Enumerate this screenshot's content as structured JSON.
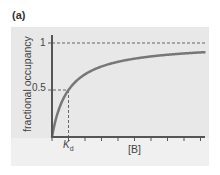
{
  "panel_label": "(a)",
  "chart_data": {
    "type": "line",
    "title": "",
    "xlabel": "[B]",
    "ylabel": "fractional occupancy",
    "ytick_labels": [
      "0.5",
      "1"
    ],
    "xtick_labels": [
      "K_d"
    ],
    "x_annotation": {
      "label": "K",
      "subscript": "d",
      "value": 1
    },
    "asymptote": {
      "y": 1,
      "style": "dashed"
    },
    "reference_line": {
      "x": 1,
      "y": 0.5,
      "style": "dashed"
    },
    "grid": false,
    "ylim": [
      0,
      1
    ],
    "xlim": [
      0,
      9
    ],
    "x_tick_count": 9,
    "series": [
      {
        "name": "fractional occupancy",
        "equation": "[B]/(K_d+[B])",
        "x": [
          0,
          0.25,
          0.5,
          1,
          1.5,
          2,
          3,
          4,
          5,
          6,
          7,
          8,
          9
        ],
        "values": [
          0,
          0.2,
          0.33,
          0.5,
          0.6,
          0.67,
          0.75,
          0.8,
          0.83,
          0.86,
          0.875,
          0.89,
          0.9
        ]
      }
    ],
    "colors": {
      "curve": "#777777",
      "axes": "#555555",
      "dashed": "#666666",
      "background": "#e8e8e8"
    }
  },
  "labels": {
    "y_axis": "fractional occupancy",
    "x_axis": "[B]",
    "y_one": "1",
    "y_half": "0.5",
    "kd_main": "K",
    "kd_sub": "d"
  }
}
